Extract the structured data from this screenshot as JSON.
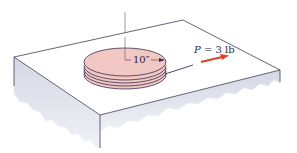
{
  "figure": {
    "radius_label": "10″",
    "force_symbol": "P",
    "force_equals": " = 3 lb",
    "force_value": 3,
    "force_unit": "lb",
    "radius_value": 10,
    "radius_unit": "in"
  },
  "colors": {
    "disk_fill": "#f2c8c4",
    "disk_edge": "#3a3050",
    "surface_top": "#ffffff",
    "surface_side": "#dde0ea",
    "outline": "#3c3c55",
    "force_arrow": "#e0402a"
  }
}
